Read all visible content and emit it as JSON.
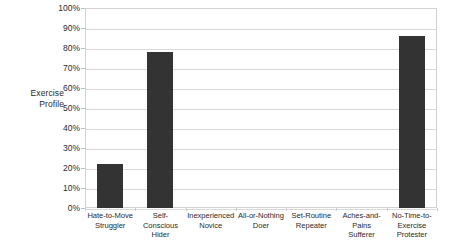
{
  "chart_data": {
    "type": "bar",
    "title": "",
    "subtitle": "",
    "xlabel": "",
    "ylabel": "Exercise Profile",
    "ylabel_lines": [
      "Exercise",
      "Profile"
    ],
    "categories": [
      "Hate-to-Move Struggler",
      "Self-Conscious Hider",
      "Inexperienced Novice",
      "All-or-Nothing Doer",
      "Set-Routine Repeater",
      "Aches-and-Pains Sufferer",
      "No-Time-to-Exercise Protester"
    ],
    "category_lines": [
      [
        "Hate-to-Move",
        "Struggler"
      ],
      [
        "Self-Conscious",
        "Hider"
      ],
      [
        "Inexperienced",
        "Novice"
      ],
      [
        "All-or-Nothing",
        "Doer"
      ],
      [
        "Set-Routine",
        "Repeater"
      ],
      [
        "Aches-and-Pains",
        "Sufferer"
      ],
      [
        "No-Time-to-",
        "Exercise Protester"
      ]
    ],
    "values": [
      22,
      78,
      0,
      0,
      0,
      0,
      86
    ],
    "value_unit": "%",
    "ylim": [
      0,
      100
    ],
    "ytick_values": [
      0,
      10,
      20,
      30,
      40,
      50,
      60,
      70,
      80,
      90,
      100
    ],
    "ytick_labels": [
      "0%",
      "10%",
      "20%",
      "30%",
      "40%",
      "50%",
      "60%",
      "70%",
      "80%",
      "90%",
      "100%"
    ],
    "grid": true,
    "legend": false,
    "legend_position": "none",
    "bar_color": "#333333",
    "grid_color": "#d9d9d9",
    "frame_color": "#d2d2d2",
    "background_color": "#ffffff"
  }
}
